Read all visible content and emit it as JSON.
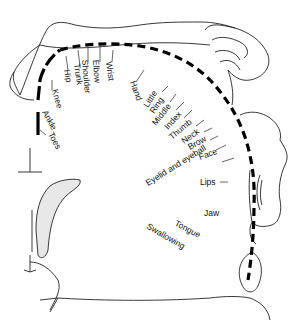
{
  "diagram": {
    "type": "motor homunculus",
    "labels": {
      "toes": "Toes",
      "ankle": "Ankle",
      "knee": "Knee",
      "hip": "Hip",
      "trunk": "Trunk",
      "shoulder": "Shoulder",
      "elbow": "Elbow",
      "wrist": "Wrist",
      "hand": "Hand",
      "little": "Little",
      "ring": "Ring",
      "middle": "Middle",
      "index": "Index",
      "thumb": "Thumb",
      "neck": "Neck",
      "brow": "Brow",
      "eyelid": "Eyelid and eyeball",
      "face": "Face",
      "lips": "Lips",
      "jaw": "Jaw",
      "tongue": "Tongue",
      "swallowing": "Swallowing"
    }
  }
}
